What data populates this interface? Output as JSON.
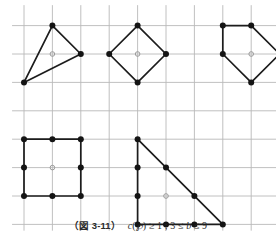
{
  "figure": {
    "label": "（図 3-11）",
    "formula_plain": "c(P) ≥ 1 ; 3 ≤ b ≤ 9",
    "formula_parts": {
      "c": "c",
      "open_paren": "(",
      "script_p": "℘",
      "close_paren": ")",
      "ge_one": " ≥ 1 ;",
      "b_range_left": " 3 ≤ ",
      "b_var": "b",
      "b_range_right": " ≤ 9"
    },
    "grid": {
      "color": "#b9b9b9",
      "spacing_px": 28.4,
      "origin_x_px": 24,
      "origin_y_px": 25.6,
      "cols": 9,
      "rows": 7,
      "line_width_px": 0.9
    },
    "style": {
      "edge_color": "#1c1c1c",
      "edge_width_px": 1.7,
      "vertex_color": "#141414",
      "vertex_radius_px": 3.0,
      "interior_marker_color": "#9a9a9a",
      "interior_marker_radius_px": 2.3,
      "background": "#ffffff"
    },
    "polygons": [
      {
        "name": "triangle-b3",
        "shape_type": "triangle",
        "vertices_grid": [
          [
            1,
            0
          ],
          [
            2,
            1
          ],
          [
            0,
            2
          ]
        ],
        "boundary_points_grid": [
          [
            1,
            0
          ],
          [
            2,
            1
          ],
          [
            0,
            2
          ]
        ],
        "interior_points_grid": [
          [
            1,
            1
          ]
        ],
        "boundary_count": 3,
        "interior_count": 1
      },
      {
        "name": "diamond-b4",
        "shape_type": "quadrilateral",
        "vertices_grid": [
          [
            4,
            0
          ],
          [
            5,
            1
          ],
          [
            4,
            2
          ],
          [
            3,
            1
          ]
        ],
        "boundary_points_grid": [
          [
            4,
            0
          ],
          [
            5,
            1
          ],
          [
            4,
            2
          ],
          [
            3,
            1
          ]
        ],
        "interior_points_grid": [
          [
            4,
            1
          ]
        ],
        "boundary_count": 4,
        "interior_count": 1
      },
      {
        "name": "pentagon-b5",
        "shape_type": "pentagon",
        "vertices_grid": [
          [
            7,
            0
          ],
          [
            8,
            0
          ],
          [
            9,
            1
          ],
          [
            8,
            2
          ],
          [
            7,
            1
          ]
        ],
        "boundary_points_grid": [
          [
            7,
            0
          ],
          [
            8,
            0
          ],
          [
            9,
            1
          ],
          [
            8,
            2
          ],
          [
            7,
            1
          ]
        ],
        "interior_points_grid": [
          [
            8,
            1
          ]
        ],
        "boundary_count": 5,
        "interior_count": 1
      },
      {
        "name": "square-b8",
        "shape_type": "square",
        "vertices_grid": [
          [
            0,
            4
          ],
          [
            2,
            4
          ],
          [
            2,
            6
          ],
          [
            0,
            6
          ]
        ],
        "boundary_points_grid": [
          [
            0,
            4
          ],
          [
            1,
            4
          ],
          [
            2,
            4
          ],
          [
            2,
            5
          ],
          [
            2,
            6
          ],
          [
            1,
            6
          ],
          [
            0,
            6
          ],
          [
            0,
            5
          ]
        ],
        "interior_points_grid": [
          [
            1,
            5
          ]
        ],
        "boundary_count": 8,
        "interior_count": 1
      },
      {
        "name": "right-triangle-b9",
        "shape_type": "right-triangle",
        "vertices_grid": [
          [
            4,
            4
          ],
          [
            7,
            7
          ],
          [
            4,
            7
          ]
        ],
        "boundary_points_grid": [
          [
            4,
            4
          ],
          [
            5,
            5
          ],
          [
            6,
            6
          ],
          [
            7,
            7
          ],
          [
            6,
            7
          ],
          [
            5,
            7
          ],
          [
            4,
            7
          ],
          [
            4,
            6
          ],
          [
            4,
            5
          ]
        ],
        "interior_points_grid": [
          [
            5,
            6
          ]
        ],
        "boundary_count": 9,
        "interior_count": 1
      }
    ]
  }
}
